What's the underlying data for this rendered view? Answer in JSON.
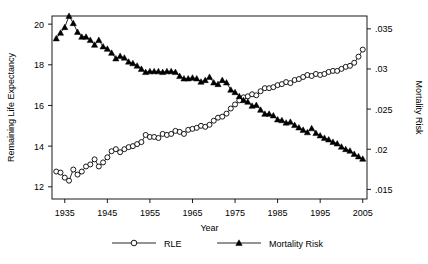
{
  "chart_data": {
    "type": "line",
    "title": "",
    "xlabel": "Year",
    "ylabel": "Remaining Life Expectancy",
    "y2label": "Mortality Risk",
    "xlim": [
      1932,
      2006
    ],
    "ylim": [
      11.4,
      20.4
    ],
    "y2lim": [
      0.0138,
      0.0366
    ],
    "xticks": [
      1935,
      1945,
      1955,
      1965,
      1975,
      1985,
      1995,
      2005
    ],
    "xticklabels": [
      "1935",
      "1945",
      "1955",
      "1965",
      "1975",
      "1985",
      "1995",
      "2005"
    ],
    "yticks": [
      12,
      14,
      16,
      18,
      20
    ],
    "yticklabels": [
      "12",
      "14",
      "16",
      "18",
      "20"
    ],
    "y2ticks": [
      0.015,
      0.02,
      0.025,
      0.03,
      0.035
    ],
    "y2ticklabels": [
      ".015",
      ".02",
      ".025",
      ".03",
      ".035"
    ],
    "grid": false,
    "legend_position": "below",
    "frame": true,
    "series": [
      {
        "name": "RLE",
        "axis": "left",
        "marker": "open-circle",
        "color": "#000000",
        "x": [
          1933,
          1934,
          1935,
          1936,
          1937,
          1938,
          1939,
          1940,
          1941,
          1942,
          1943,
          1944,
          1945,
          1946,
          1947,
          1948,
          1949,
          1950,
          1951,
          1952,
          1953,
          1954,
          1955,
          1956,
          1957,
          1958,
          1959,
          1960,
          1961,
          1962,
          1963,
          1964,
          1965,
          1966,
          1967,
          1968,
          1969,
          1970,
          1971,
          1972,
          1973,
          1974,
          1975,
          1976,
          1977,
          1978,
          1979,
          1980,
          1981,
          1982,
          1983,
          1984,
          1985,
          1986,
          1987,
          1988,
          1989,
          1990,
          1991,
          1992,
          1993,
          1994,
          1995,
          1996,
          1997,
          1998,
          1999,
          2000,
          2001,
          2002,
          2003,
          2004,
          2005
        ],
        "values": [
          12.75,
          12.7,
          12.45,
          12.3,
          12.85,
          12.6,
          12.75,
          13.0,
          13.1,
          13.35,
          13.0,
          13.2,
          13.45,
          13.75,
          13.85,
          13.7,
          13.85,
          13.95,
          14.0,
          14.1,
          14.2,
          14.55,
          14.45,
          14.45,
          14.4,
          14.6,
          14.55,
          14.6,
          14.75,
          14.7,
          14.6,
          14.8,
          14.85,
          14.9,
          15.0,
          14.95,
          15.05,
          15.25,
          15.4,
          15.45,
          15.6,
          15.85,
          16.05,
          16.25,
          16.4,
          16.45,
          16.55,
          16.5,
          16.7,
          16.85,
          16.85,
          16.9,
          17.0,
          17.05,
          17.15,
          17.1,
          17.25,
          17.3,
          17.4,
          17.5,
          17.45,
          17.55,
          17.5,
          17.55,
          17.65,
          17.7,
          17.7,
          17.8,
          17.9,
          17.95,
          18.1,
          18.4,
          18.75
        ]
      },
      {
        "name": "Mortality Risk",
        "axis": "right",
        "marker": "filled-triangle",
        "color": "#000000",
        "x": [
          1933,
          1934,
          1935,
          1936,
          1937,
          1938,
          1939,
          1940,
          1941,
          1942,
          1943,
          1944,
          1945,
          1946,
          1947,
          1948,
          1949,
          1950,
          1951,
          1952,
          1953,
          1954,
          1955,
          1956,
          1957,
          1958,
          1959,
          1960,
          1961,
          1962,
          1963,
          1964,
          1965,
          1966,
          1967,
          1968,
          1969,
          1970,
          1971,
          1972,
          1973,
          1974,
          1975,
          1976,
          1977,
          1978,
          1979,
          1980,
          1981,
          1982,
          1983,
          1984,
          1985,
          1986,
          1987,
          1988,
          1989,
          1990,
          1991,
          1992,
          1993,
          1994,
          1995,
          1996,
          1997,
          1998,
          1999,
          2000,
          2001,
          2002,
          2003,
          2004,
          2005
        ],
        "values": [
          0.0338,
          0.0345,
          0.0352,
          0.0366,
          0.0357,
          0.0346,
          0.034,
          0.034,
          0.0336,
          0.033,
          0.0336,
          0.0328,
          0.0325,
          0.032,
          0.0313,
          0.0316,
          0.0314,
          0.0309,
          0.0307,
          0.0304,
          0.03,
          0.0296,
          0.0297,
          0.0297,
          0.0297,
          0.0296,
          0.0297,
          0.0297,
          0.0296,
          0.0291,
          0.0288,
          0.0288,
          0.0289,
          0.0288,
          0.0284,
          0.0286,
          0.029,
          0.0283,
          0.0281,
          0.0286,
          0.0283,
          0.0274,
          0.0271,
          0.0266,
          0.0261,
          0.0259,
          0.0254,
          0.0255,
          0.0249,
          0.0244,
          0.0244,
          0.0242,
          0.0237,
          0.0236,
          0.0233,
          0.0234,
          0.023,
          0.0227,
          0.0224,
          0.0221,
          0.0226,
          0.022,
          0.0217,
          0.0214,
          0.0212,
          0.0209,
          0.0207,
          0.0203,
          0.02,
          0.0198,
          0.0194,
          0.0191,
          0.0188
        ]
      }
    ],
    "legend": [
      {
        "label": "RLE",
        "marker": "open-circle"
      },
      {
        "label": "Mortality Risk",
        "marker": "filled-triangle"
      }
    ]
  }
}
